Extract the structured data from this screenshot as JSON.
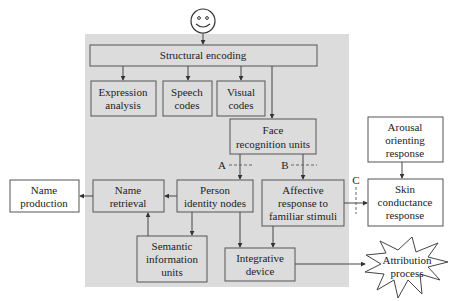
{
  "diagram": {
    "nodes": {
      "structural_encoding": {
        "lines": [
          "Structural encoding"
        ]
      },
      "expression_analysis": {
        "lines": [
          "Expression",
          "analysis"
        ]
      },
      "speech_codes": {
        "lines": [
          "Speech",
          "codes"
        ]
      },
      "visual_codes": {
        "lines": [
          "Visual",
          "codes"
        ]
      },
      "face_recognition_units": {
        "lines": [
          "Face",
          "recognition units"
        ]
      },
      "person_identity_nodes": {
        "lines": [
          "Person",
          "identity nodes"
        ]
      },
      "name_retrieval": {
        "lines": [
          "Name",
          "retrieval"
        ]
      },
      "name_production": {
        "lines": [
          "Name",
          "production"
        ]
      },
      "semantic_information_units": {
        "lines": [
          "Semantic",
          "information",
          "units"
        ]
      },
      "affective_response": {
        "lines": [
          "Affective",
          "response to",
          "familiar stimuli"
        ]
      },
      "integrative_device": {
        "lines": [
          "Integrative",
          "device"
        ]
      },
      "arousal_orienting_response": {
        "lines": [
          "Arousal",
          "orienting",
          "response"
        ]
      },
      "skin_conductance_response": {
        "lines": [
          "Skin",
          "conductance",
          "response"
        ]
      },
      "attribution_process": {
        "lines": [
          "Attribution",
          "process"
        ]
      }
    },
    "pathway_labels": {
      "a": "A",
      "b": "B",
      "c": "C"
    },
    "input_icon": "smiley-face-icon",
    "colors": {
      "panel": "#dcdcdc",
      "stroke": "#555555",
      "text": "#222222"
    }
  }
}
